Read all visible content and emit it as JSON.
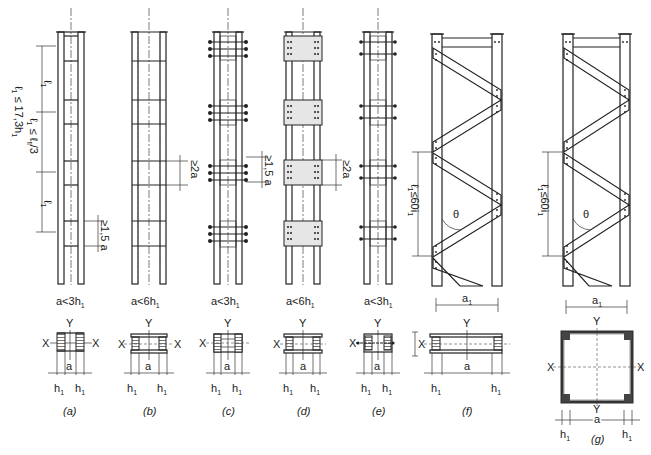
{
  "figure": {
    "panels": [
      {
        "id": "a",
        "caption": "(a)",
        "type": "battened column (welded batten plates)",
        "condition": "a<3h",
        "condition_sub": "1",
        "dimensions": {
          "spacing_note_1": "ℓ₁ ≤ ℓ_fl/3",
          "spacing_note_2": "ℓ₁ ≤ 17,3h₁",
          "panel_label": "ℓ₁",
          "batten_min": "≥1,5 a"
        },
        "section": {
          "x_label": "X",
          "y_label": "Y",
          "width_label": "a",
          "flange_labels": [
            "h₁",
            "h₁"
          ]
        }
      },
      {
        "id": "b",
        "caption": "(b)",
        "type": "battened column (wide batten plates)",
        "condition": "a<6h",
        "condition_sub": "1",
        "dimensions": {
          "batten_min": "≥2a"
        },
        "section": {
          "x_label": "X",
          "y_label": "Y",
          "width_label": "a",
          "flange_labels": [
            "h₁",
            "h₁"
          ]
        }
      },
      {
        "id": "c",
        "caption": "(c)",
        "type": "battened column (bolted batten plates)",
        "condition": "a<3h",
        "condition_sub": "1",
        "dimensions": {
          "batten_min": "≥1,5 a"
        },
        "section": {
          "x_label": "X",
          "y_label": "Y",
          "width_label": "a",
          "flange_labels": [
            "h₁",
            "h₁"
          ]
        }
      },
      {
        "id": "d",
        "caption": "(d)",
        "type": "battened column (bolted double plates)",
        "condition": "a<6h",
        "condition_sub": "1",
        "dimensions": {
          "batten_min": "≥2a"
        },
        "section": {
          "x_label": "X",
          "y_label": "Y",
          "width_label": "a",
          "flange_labels": [
            "h₁",
            "h₁"
          ]
        }
      },
      {
        "id": "e",
        "caption": "(e)",
        "type": "battened column (through-bolted)",
        "condition": "a<3h",
        "condition_sub": "1",
        "dimensions": {},
        "section": {
          "x_label": "X",
          "y_label": "Y",
          "width_label": "a",
          "flange_labels": [
            "h₁",
            "h₁"
          ]
        }
      },
      {
        "id": "f",
        "caption": "(f)",
        "type": "laced column (single lacing)",
        "dimensions": {
          "lacing_spacing": "ℓ₁≤60i₁",
          "angle": "θ"
        },
        "section": {
          "x_label": "X",
          "y_label": "Y",
          "width_label": "a",
          "outer_width_label": "a₁",
          "flange_labels": [
            "h₁",
            "h₁"
          ]
        }
      },
      {
        "id": "g",
        "caption": "(g)",
        "type": "laced column (four-angle box)",
        "dimensions": {
          "lacing_spacing": "ℓ₁≤60i₁",
          "angle": "θ"
        },
        "section": {
          "x_label_left": "X",
          "x_label_right": "X",
          "y_label_top": "Y",
          "y_label_bottom": "Y",
          "width_label": "a",
          "outer_width_label": "a₁",
          "flange_labels": [
            "h₁",
            "h₁"
          ]
        }
      }
    ],
    "text": {
      "l1": "ℓ",
      "sub1": "1",
      "le_fl": "≤ ℓ",
      "fl_sub": "fl",
      "div3": "/3",
      "le173": "≤ 17,3h",
      "ge15a": "≥1,5 a",
      "ge2a": "≥2a",
      "le60": "≤60i",
      "theta": "θ",
      "X": "X",
      "Y": "Y",
      "a": "a",
      "a1": "a",
      "h": "h"
    }
  }
}
